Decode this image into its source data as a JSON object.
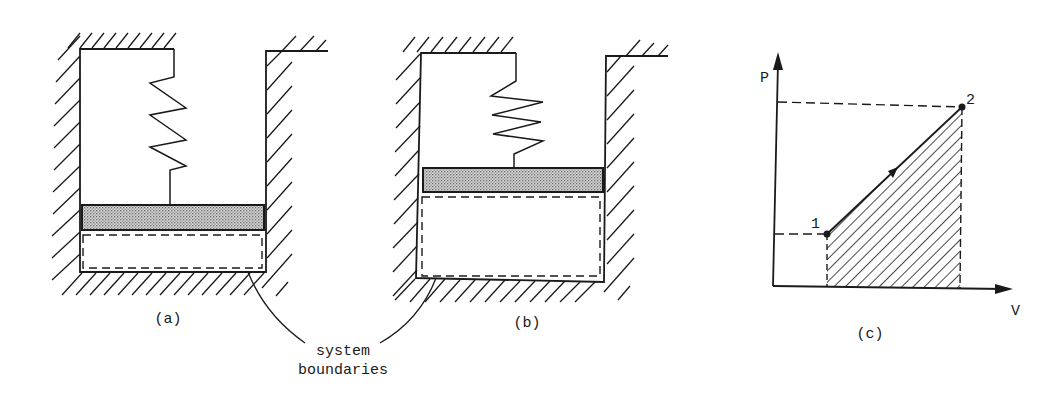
{
  "figure": {
    "panels": [
      {
        "id": "a",
        "caption": "(a)",
        "description": "Piston-cylinder with spring, piston low, small gas volume"
      },
      {
        "id": "b",
        "caption": "(b)",
        "description": "Piston-cylinder with spring compressed, piston raised, larger gas volume"
      },
      {
        "id": "c",
        "caption": "(c)",
        "description": "P-V diagram, linear process from state 1 to state 2, work area hatched"
      }
    ],
    "annotation": {
      "line1": "system",
      "line2": "boundaries"
    },
    "pv_diagram": {
      "y_axis_label": "P",
      "x_axis_label": "V",
      "state1_label": "1",
      "state2_label": "2"
    }
  },
  "colors": {
    "ink": "#1a1a1a",
    "piston_fill": "#b8b8b8",
    "background": "#ffffff"
  }
}
